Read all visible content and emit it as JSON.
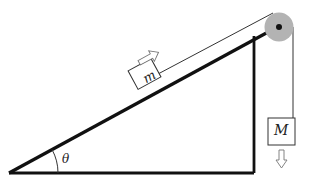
{
  "diagram": {
    "type": "incline-pulley-system",
    "labels": {
      "block_on_incline": "m",
      "hanging_block": "M",
      "angle": "θ"
    },
    "arrows": {
      "block_m_motion": "up-the-incline",
      "block_M_motion": "down"
    },
    "colors": {
      "line": "#111111",
      "pulley": "#b0b0b0",
      "axle": "#111111",
      "box_border": "#333333",
      "arrow_outline": "#777777"
    }
  }
}
